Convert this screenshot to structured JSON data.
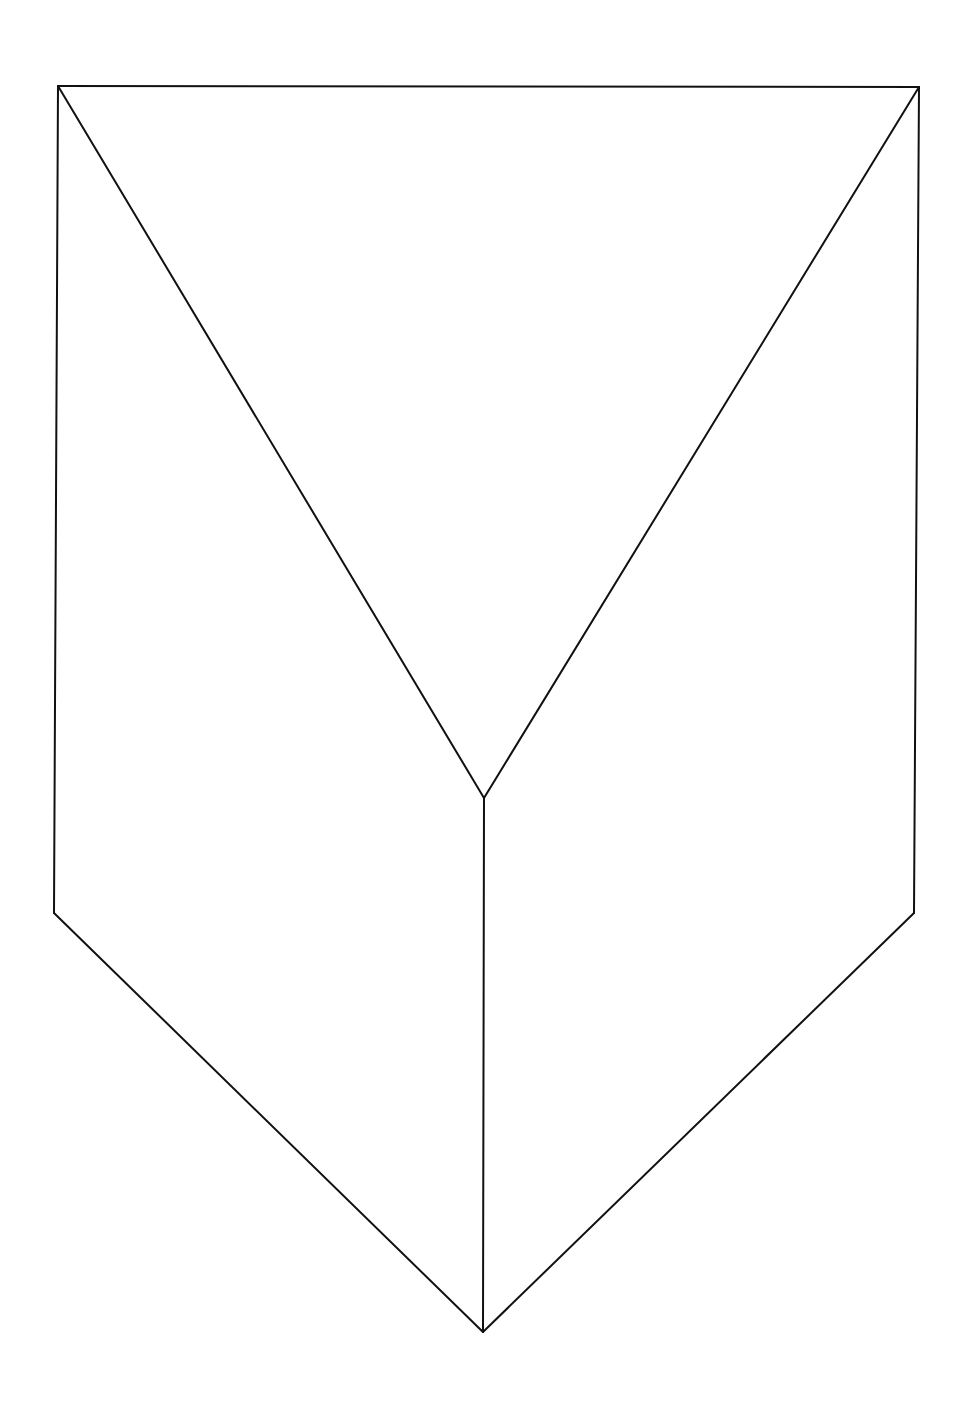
{
  "diagram": {
    "type": "line-drawing",
    "stroke_color": "#111111",
    "background_color": "#ffffff",
    "vertices": {
      "top_left": [
        58,
        86
      ],
      "top_right": [
        919,
        87
      ],
      "center": [
        484,
        798
      ],
      "bottom_left": [
        54,
        913
      ],
      "bottom_right": [
        914,
        913
      ],
      "bottom_tip": [
        483,
        1332
      ]
    },
    "edges": [
      {
        "name": "top-edge",
        "from": "top_left",
        "to": "top_right"
      },
      {
        "name": "left-side-edge",
        "from": "top_left",
        "to": "bottom_left"
      },
      {
        "name": "right-side-edge",
        "from": "top_right",
        "to": "bottom_right"
      },
      {
        "name": "left-diagonal-edge",
        "from": "top_left",
        "to": "center"
      },
      {
        "name": "right-diagonal-edge",
        "from": "top_right",
        "to": "center"
      },
      {
        "name": "center-vertical-edge",
        "from": "center",
        "to": "bottom_tip"
      },
      {
        "name": "bottom-left-edge",
        "from": "bottom_left",
        "to": "bottom_tip"
      },
      {
        "name": "bottom-right-edge",
        "from": "bottom_right",
        "to": "bottom_tip"
      }
    ]
  }
}
